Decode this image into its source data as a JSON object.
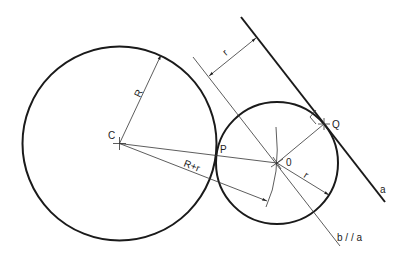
{
  "diagram": {
    "title": "",
    "labels": {
      "center_big": "C",
      "center_small": "0",
      "tangent_point_circles": "P",
      "tangent_point_line": "Q",
      "radius_big": "R",
      "radius_small_dim": "r",
      "radius_small_offset": "r",
      "sum_radii": "R+r",
      "line_a": "a",
      "line_b": "b / / a"
    },
    "colors": {
      "stroke": "#1a1a1a",
      "text": "#222222",
      "background": "#ffffff"
    }
  }
}
